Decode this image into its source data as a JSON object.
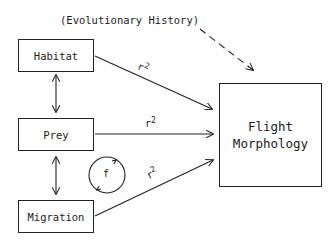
{
  "diagram": {
    "top_label": "(Evolutionary History)",
    "nodes": {
      "habitat": "Habitat",
      "prey": "Prey",
      "migration": "Migration",
      "target_line1": "Flight",
      "target_line2": "Morphology"
    },
    "edge_labels": {
      "habitat_to_target": "r",
      "prey_to_target": "r",
      "migration_to_target": "r",
      "exponent": "2"
    },
    "feedback_label": "f"
  }
}
